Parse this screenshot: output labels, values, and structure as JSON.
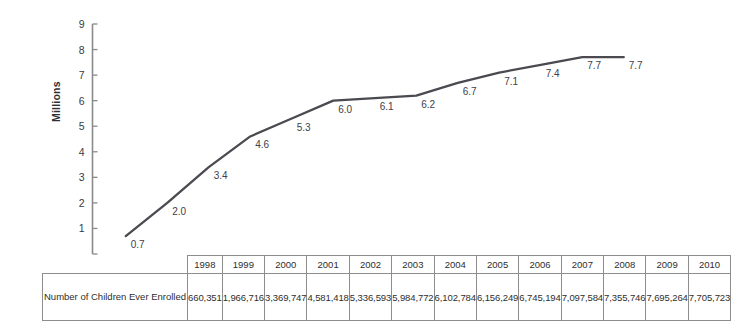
{
  "chart_data": {
    "type": "line",
    "title": "",
    "xlabel": "",
    "ylabel": "Millions",
    "ylim": [
      0,
      9
    ],
    "yticks": [
      1,
      2,
      3,
      4,
      5,
      6,
      7,
      8,
      9
    ],
    "grid": false,
    "legend": "none",
    "line_color": "#4a4a50",
    "categories": [
      "1998",
      "1999",
      "2000",
      "2001",
      "2002",
      "2003",
      "2004",
      "2005",
      "2006",
      "2007",
      "2008",
      "2009",
      "2010"
    ],
    "values": [
      0.7,
      2.0,
      3.4,
      4.6,
      5.3,
      6.0,
      6.1,
      6.2,
      6.7,
      7.1,
      7.4,
      7.7,
      7.7
    ],
    "point_labels": [
      "0.7",
      "2.0",
      "3.4",
      "4.6",
      "5.3",
      "6.0",
      "6.1",
      "6.2",
      "6.7",
      "7.1",
      "7.4",
      "7.7",
      "7.7"
    ],
    "series": [
      {
        "name": "Number of Children Ever Enrolled",
        "values": [
          0.7,
          2.0,
          3.4,
          4.6,
          5.3,
          6.0,
          6.1,
          6.2,
          6.7,
          7.1,
          7.4,
          7.7,
          7.7
        ]
      }
    ]
  },
  "table": {
    "row_header": "Number of Children Ever Enrolled",
    "columns": [
      "1998",
      "1999",
      "2000",
      "2001",
      "2002",
      "2003",
      "2004",
      "2005",
      "2006",
      "2007",
      "2008",
      "2009",
      "2010"
    ],
    "values": [
      "660,351",
      "1,966,716",
      "3,369,747",
      "4,581,418",
      "5,336,593",
      "5,984,772",
      "6,102,784",
      "6,156,249",
      "6,745,194",
      "7,097,584",
      "7,355,746",
      "7,695,264",
      "7,705,723"
    ]
  }
}
